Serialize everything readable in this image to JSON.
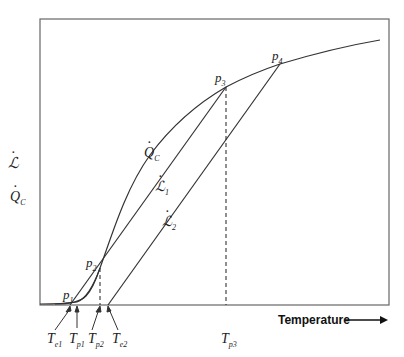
{
  "figure": {
    "y_axis_labels": {
      "L": "ℒ",
      "Qc": "Q",
      "Qc_sub": "C"
    },
    "x_axis_label": "Temperature",
    "x_axis_arrow": "→",
    "curves": {
      "Qc": {
        "label": "Q",
        "sub": "C"
      },
      "L1": {
        "label": "ℒ",
        "sub": "1"
      },
      "L2": {
        "label": "ℒ",
        "sub": "2"
      }
    },
    "points": [
      {
        "name": "p",
        "sub": "1"
      },
      {
        "name": "p",
        "sub": "2"
      },
      {
        "name": "p",
        "sub": "3"
      },
      {
        "name": "p",
        "sub": "4"
      }
    ],
    "x_ticks": [
      {
        "label": "T",
        "sub": "e1"
      },
      {
        "label": "T",
        "sub": "p1"
      },
      {
        "label": "T",
        "sub": "p2"
      },
      {
        "label": "T",
        "sub": "e2"
      },
      {
        "label": "T",
        "sub": "p3"
      }
    ],
    "colors": {
      "line": "#333333",
      "frame": "#555555"
    }
  }
}
